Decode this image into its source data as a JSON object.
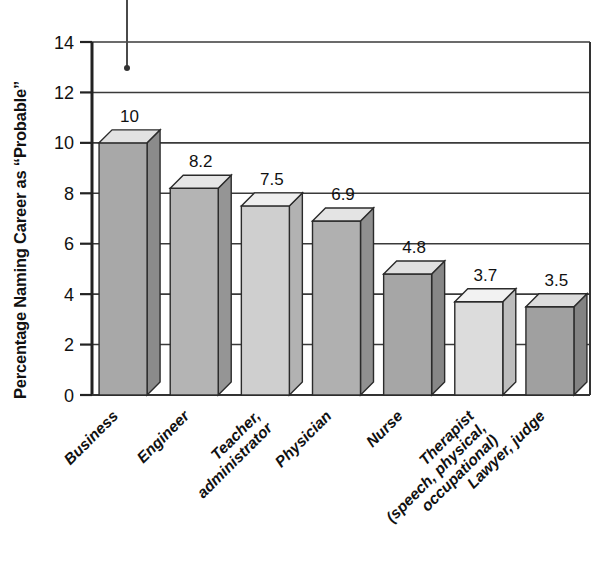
{
  "chart_data": {
    "type": "bar",
    "title": "",
    "subtitle": "",
    "xlabel": "",
    "ylabel": "Percentage Naming Career as “Probable”",
    "categories": [
      "Business",
      "Engineer",
      "Teacher,\nadministrator",
      "Physician",
      "Nurse",
      "Therapist\n(speech, physical,\noccupational)",
      "Lawyer, judge"
    ],
    "values": [
      10,
      8.2,
      7.5,
      6.9,
      4.8,
      3.7,
      3.5
    ],
    "data_labels": [
      "10",
      "8.2",
      "7.5",
      "6.9",
      "4.8",
      "3.7",
      "3.5"
    ],
    "ylim": [
      0,
      14
    ],
    "ytick_values": [
      0,
      2,
      4,
      6,
      8,
      10,
      12,
      14
    ],
    "ytick_labels": [
      "0",
      "2",
      "4",
      "6",
      "8",
      "10",
      "12",
      "14"
    ],
    "grid": true,
    "grid_axis": "y",
    "legend": false,
    "legend_position": "none",
    "style": "3d-bar",
    "bar_face_colors": [
      "#a8a8a8",
      "#b4b4b4",
      "#cfcfcf",
      "#b0b0b0",
      "#a6a6a6",
      "#dcdcdc",
      "#a0a0a0"
    ],
    "bar_top_colors": [
      "#e2e2e2",
      "#e6e6e6",
      "#efefef",
      "#e4e4e4",
      "#e0e0e0",
      "#f2f2f2",
      "#dcdcdc"
    ],
    "bar_side_colors": [
      "#8b8b8b",
      "#959595",
      "#b2b2b2",
      "#909090",
      "#878787",
      "#bdbdbd",
      "#838383"
    ],
    "annotations": [
      {
        "name": "pin-marker",
        "type": "vertical-line-with-dot",
        "x_px": 127,
        "y_top_px": 0,
        "y_bottom_px": 68
      }
    ]
  },
  "axes": {
    "y_axis_name": "percentage-axis",
    "x_axis_name": "career-axis"
  },
  "colors": {
    "axis": "#222222",
    "grid": "#3a3a3a",
    "text": "#111111",
    "background": "#ffffff"
  }
}
